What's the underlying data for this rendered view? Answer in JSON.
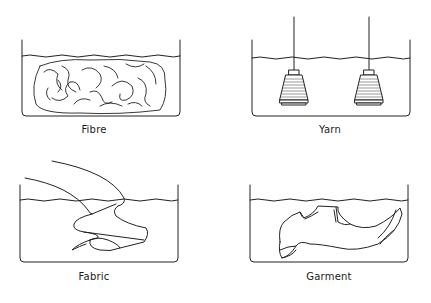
{
  "diagram": {
    "panels": [
      {
        "id": "fibre",
        "label": "Fibre"
      },
      {
        "id": "yarn",
        "label": "Yarn"
      },
      {
        "id": "fabric",
        "label": "Fabric"
      },
      {
        "id": "garment",
        "label": "Garment"
      }
    ]
  }
}
